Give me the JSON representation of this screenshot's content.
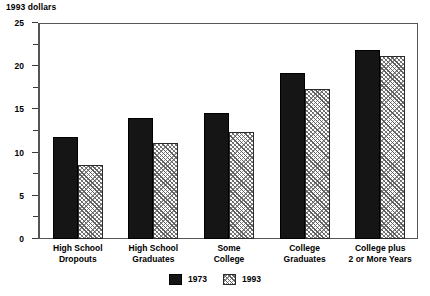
{
  "chart_data": {
    "type": "bar",
    "title": "",
    "unit_label": "1993 dollars",
    "xlabel": "",
    "ylabel": "",
    "ylim": [
      0,
      25
    ],
    "y_major_ticks": [
      0,
      5,
      10,
      15,
      20,
      25
    ],
    "y_minor_ticks": [
      2.5,
      7.5,
      12.5,
      17.5,
      22.5
    ],
    "y_tick_labels": [
      "0",
      "5",
      "10",
      "15",
      "20",
      "25"
    ],
    "grid": false,
    "legend_position": "bottom-center",
    "categories": [
      "High School Dropouts",
      "High School Graduates",
      "Some College",
      "College Graduates",
      "College plus 2 or More Years"
    ],
    "category_lines": [
      [
        "High School",
        "Dropouts"
      ],
      [
        "High School",
        "Graduates"
      ],
      [
        "Some",
        "College"
      ],
      [
        "College",
        "Graduates"
      ],
      [
        "College plus",
        "2 or More Years"
      ]
    ],
    "series": [
      {
        "name": "1973",
        "color": "#151515",
        "pattern": "solid",
        "values": [
          11.8,
          14.0,
          14.6,
          19.2,
          21.9
        ]
      },
      {
        "name": "1993",
        "color": "#8c8c8c",
        "pattern": "crosshatch",
        "values": [
          8.6,
          11.1,
          12.4,
          17.4,
          21.2
        ]
      }
    ]
  },
  "legend": {
    "items": [
      {
        "label": "1973"
      },
      {
        "label": "1993"
      }
    ]
  }
}
